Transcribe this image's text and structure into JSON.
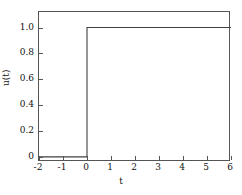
{
  "chart_data": {
    "type": "line",
    "title": "",
    "xlabel": "t",
    "ylabel": "u(t)",
    "xlim": [
      -2,
      6
    ],
    "ylim": [
      -0.04,
      1.12
    ],
    "grid": false,
    "legend": null,
    "xticks": [
      -2,
      -1,
      0,
      1,
      2,
      3,
      4,
      5,
      6
    ],
    "xticklabels": [
      "-2",
      "-1",
      "0",
      "1",
      "2",
      "3",
      "4",
      "5",
      "6"
    ],
    "yticks": [
      0,
      0.2,
      0.4,
      0.6,
      0.8,
      1.0
    ],
    "yticklabels": [
      "0",
      "0.2",
      "0.4",
      "0.6",
      "0.8",
      "1.0"
    ],
    "series": [
      {
        "name": "unit step",
        "color": "#404040",
        "x": [
          -2,
          0,
          0,
          6
        ],
        "y": [
          0,
          0,
          1,
          1
        ]
      }
    ]
  },
  "figure": {
    "frame_color": "#555555",
    "background": "#ffffff"
  }
}
